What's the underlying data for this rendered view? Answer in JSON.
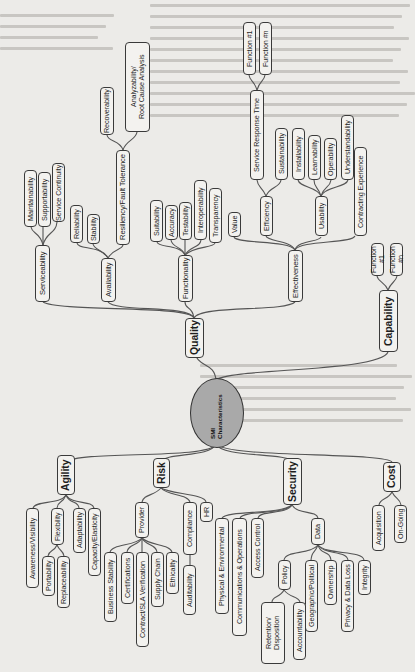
{
  "diagram": {
    "orientation": "rotated 90 degrees counter-clockwise (text reads bottom-to-top)",
    "root": {
      "label": "SMI\nCharacteristics",
      "fill": "#a9a9a9"
    },
    "colors": {
      "page": "#ecebe8",
      "node_fill": "#f3f2ef",
      "node_border": "#3a3a3a",
      "connector": "#555555",
      "text": "#1e1e1e"
    },
    "branches": {
      "quality": {
        "label": "Quality",
        "serviceability": {
          "label": "Serviceability",
          "children": [
            "Maintainability",
            "Supportability",
            "Service Continuity"
          ]
        },
        "availability": {
          "label": "Availability",
          "children": [
            "Reliability",
            "Stability"
          ]
        },
        "resiliency": {
          "label": "Resiliency/Fault Tolerance",
          "children": [
            "Recoverability",
            "Analyzability/\nRoot Cause Analysis"
          ]
        },
        "functionality": {
          "label": "Functionality",
          "children": [
            "Suitability",
            "Accuracy",
            "Testability",
            "Interoperability",
            "Transparency"
          ]
        },
        "effectiveness": {
          "label": "Effectiveness",
          "value": "Value",
          "efficiency": {
            "label": "Efficiency",
            "children": [
              "Service Response Time",
              "Sustainability"
            ]
          },
          "service_response_time": {
            "children": [
              "Function #1",
              "Function #n"
            ]
          },
          "usability": {
            "label": "Usability",
            "children": [
              "Installability",
              "Learnability",
              "Operability",
              "Understandability"
            ]
          },
          "contracting_experience": "Contracting Experience"
        }
      },
      "capability": {
        "label": "Capability",
        "children": [
          "Function #1",
          "Function #n"
        ]
      },
      "agility": {
        "label": "Agility",
        "children": [
          "Awareness/Visibility",
          "Flexibility",
          "Adaptability",
          "Capacity/Elasticity"
        ],
        "flexibility_children": [
          "Portability",
          "Replaceability"
        ]
      },
      "risk": {
        "label": "Risk",
        "provider": {
          "label": "Provider",
          "children": [
            "Business Stability",
            "Certifications",
            "Contract/SLA Verification",
            "Supply Chain",
            "Ethicality"
          ]
        },
        "compliance": {
          "label": "Compliance",
          "children": [
            "Auditability"
          ]
        },
        "hr": "HR"
      },
      "security": {
        "label": "Security",
        "children": [
          "Physical & Environmental",
          "Communications & Operations",
          "Access Control"
        ],
        "data": {
          "label": "Data",
          "children": [
            "Geographic/Political",
            "Ownership",
            "Privacy & Data Loss",
            "Integrity"
          ]
        },
        "policy": {
          "label": "Policy",
          "children": [
            "Retention/\nDisposition",
            "Accountability"
          ]
        }
      },
      "cost": {
        "label": "Cost",
        "children": [
          "Acquisition",
          "On-Going"
        ]
      }
    }
  }
}
